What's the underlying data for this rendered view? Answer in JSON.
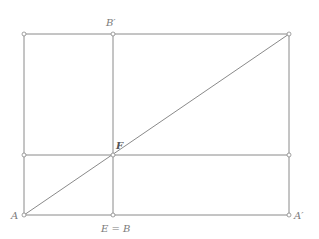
{
  "diagram": {
    "title": "",
    "colors": {
      "line": "#8a8a8a",
      "label": "#7a7a7a",
      "label_emphasis": "#555555",
      "background": "#ffffff"
    },
    "points": [
      {
        "id": "A",
        "label": "A"
      },
      {
        "id": "E",
        "label": "E = B"
      },
      {
        "id": "A_prime",
        "label": "A′"
      },
      {
        "id": "B_prime",
        "label": "B′"
      },
      {
        "id": "F",
        "label": "F"
      },
      {
        "id": "top_left",
        "label": ""
      },
      {
        "id": "top_right",
        "label": ""
      },
      {
        "id": "mid_left",
        "label": ""
      },
      {
        "id": "mid_right",
        "label": ""
      }
    ],
    "segments": [
      {
        "from": "top_left",
        "to": "top_right",
        "name": "top-edge"
      },
      {
        "from": "A",
        "to": "A_prime",
        "name": "bottom-edge"
      },
      {
        "from": "top_left",
        "to": "A",
        "name": "left-edge"
      },
      {
        "from": "top_right",
        "to": "A_prime",
        "name": "right-edge"
      },
      {
        "from": "B_prime",
        "to": "E",
        "name": "vertical-divider"
      },
      {
        "from": "mid_left",
        "to": "mid_right",
        "name": "horizontal-divider"
      },
      {
        "from": "A",
        "to": "top_right",
        "name": "diagonal"
      }
    ],
    "relations": "Rectangle with vertical line B′E and horizontal line through F; diagonal from A to the opposite corner passes through F."
  }
}
